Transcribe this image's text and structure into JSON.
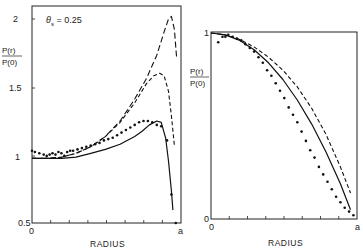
{
  "chart_data": [
    {
      "type": "line",
      "panel": "left",
      "title": "",
      "annotation": "θs = 0.25",
      "xlabel": "RADIUS",
      "ylabel": "P(r) / P(0)",
      "ylabel_num": "P(r)",
      "ylabel_den": "P(0)",
      "x_tick_labels": [
        "0",
        "a"
      ],
      "y_ticks": [
        0.5,
        1,
        1.5,
        2
      ],
      "y_tick_labels": [
        "0.5",
        "1",
        "1.5",
        "2"
      ],
      "xlim": [
        0,
        1
      ],
      "ylim": [
        0.5,
        2.12
      ],
      "grid": false,
      "series": [
        {
          "name": "long-dash",
          "style": "dashed-long",
          "x": [
            0,
            0.1,
            0.2,
            0.3,
            0.4,
            0.5,
            0.6,
            0.7,
            0.78,
            0.85,
            0.9,
            0.93,
            0.95,
            0.97,
            0.985
          ],
          "y": [
            1.0,
            1.0,
            1.01,
            1.04,
            1.09,
            1.17,
            1.29,
            1.46,
            1.62,
            1.8,
            1.98,
            2.08,
            2.1,
            2.0,
            1.78
          ]
        },
        {
          "name": "dash-dot",
          "style": "dashed-short",
          "x": [
            0,
            0.1,
            0.2,
            0.3,
            0.4,
            0.5,
            0.6,
            0.7,
            0.78,
            0.83,
            0.87,
            0.9,
            0.93,
            0.95,
            0.97
          ],
          "y": [
            1.0,
            1.0,
            1.01,
            1.04,
            1.09,
            1.17,
            1.28,
            1.43,
            1.58,
            1.64,
            1.66,
            1.64,
            1.52,
            1.33,
            1.1
          ]
        },
        {
          "name": "solid",
          "style": "solid",
          "x": [
            0,
            0.1,
            0.2,
            0.3,
            0.4,
            0.5,
            0.6,
            0.7,
            0.75,
            0.8,
            0.85,
            0.88,
            0.91,
            0.93,
            0.95,
            0.96
          ],
          "y": [
            1.0,
            1.0,
            1.0,
            1.01,
            1.04,
            1.07,
            1.11,
            1.17,
            1.21,
            1.26,
            1.29,
            1.28,
            1.16,
            0.98,
            0.75,
            0.6
          ]
        },
        {
          "name": "data points",
          "style": "dots",
          "x": [
            0.0,
            0.02,
            0.05,
            0.08,
            0.1,
            0.12,
            0.14,
            0.16,
            0.18,
            0.2,
            0.22,
            0.24,
            0.26,
            0.28,
            0.31,
            0.34,
            0.37,
            0.4,
            0.43,
            0.46,
            0.49,
            0.52,
            0.55,
            0.58,
            0.61,
            0.64,
            0.67,
            0.7,
            0.73,
            0.76,
            0.79,
            0.82,
            0.85,
            0.88,
            0.92,
            0.95,
            0.98
          ],
          "y": [
            1.06,
            1.05,
            1.04,
            1.03,
            1.02,
            1.03,
            1.04,
            1.03,
            1.05,
            1.04,
            1.02,
            1.05,
            1.06,
            1.06,
            1.07,
            1.08,
            1.09,
            1.1,
            1.11,
            1.12,
            1.14,
            1.15,
            1.16,
            1.18,
            1.2,
            1.22,
            1.24,
            1.26,
            1.28,
            1.29,
            1.29,
            1.28,
            1.26,
            1.25,
            1.14,
            0.72,
            0.5
          ]
        }
      ]
    },
    {
      "type": "line",
      "panel": "right",
      "title": "",
      "xlabel": "RADIUS",
      "ylabel": "P(r) / P(0)",
      "ylabel_num": "P(r)",
      "ylabel_den": "P(0)",
      "x_tick_labels": [
        "0",
        "a"
      ],
      "y_ticks": [
        0,
        1
      ],
      "y_tick_labels": [
        "0",
        "1"
      ],
      "xlim": [
        0,
        1
      ],
      "ylim": [
        0,
        1
      ],
      "grid": false,
      "series": [
        {
          "name": "dashed",
          "style": "dashed-short",
          "x": [
            0,
            0.1,
            0.2,
            0.3,
            0.4,
            0.5,
            0.6,
            0.7,
            0.8,
            0.9,
            0.97
          ],
          "y": [
            1.0,
            0.99,
            0.965,
            0.925,
            0.87,
            0.8,
            0.71,
            0.595,
            0.455,
            0.28,
            0.14
          ]
        },
        {
          "name": "solid",
          "style": "solid",
          "x": [
            0,
            0.1,
            0.2,
            0.3,
            0.4,
            0.5,
            0.6,
            0.7,
            0.8,
            0.9,
            0.97
          ],
          "y": [
            1.0,
            0.99,
            0.96,
            0.91,
            0.84,
            0.75,
            0.64,
            0.51,
            0.36,
            0.19,
            0.05
          ]
        },
        {
          "name": "data points",
          "style": "dots",
          "x": [
            0.05,
            0.08,
            0.1,
            0.12,
            0.15,
            0.18,
            0.21,
            0.24,
            0.27,
            0.3,
            0.33,
            0.36,
            0.39,
            0.42,
            0.45,
            0.48,
            0.51,
            0.54,
            0.57,
            0.6,
            0.63,
            0.66,
            0.69,
            0.72,
            0.75,
            0.78,
            0.81,
            0.84,
            0.87,
            0.9,
            0.93,
            0.96,
            0.99
          ],
          "y": [
            0.95,
            0.98,
            0.98,
            0.99,
            0.98,
            0.97,
            0.96,
            0.94,
            0.92,
            0.9,
            0.87,
            0.84,
            0.8,
            0.77,
            0.73,
            0.69,
            0.65,
            0.6,
            0.56,
            0.52,
            0.47,
            0.42,
            0.37,
            0.33,
            0.28,
            0.24,
            0.2,
            0.16,
            0.12,
            0.09,
            0.06,
            0.04,
            0.02
          ]
        }
      ]
    }
  ],
  "panels": {
    "left": {
      "annotation_theta": "θ",
      "annotation_sub": "s",
      "annotation_value": " = 0.25"
    }
  }
}
